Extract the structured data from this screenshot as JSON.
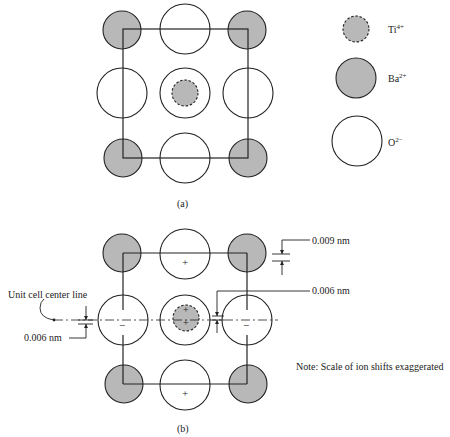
{
  "figure": {
    "part_a": {
      "caption": "(a)",
      "description": "Unit cell of BaTiO3 projected: Ba2+ corners, O2- edge/face centers, Ti4+ at center"
    },
    "part_b": {
      "caption": "(b)",
      "description": "Tetragonal distortion showing ion shifts relative to unit cell center line"
    },
    "legend": {
      "items": [
        {
          "ion": "Ti",
          "charge": "4+",
          "style": "dashed-gray"
        },
        {
          "ion": "Ba",
          "charge": "2+",
          "style": "solid-gray"
        },
        {
          "ion": "O",
          "charge": "2−",
          "style": "white"
        }
      ]
    },
    "annotations": {
      "center_line_label": "Unit cell center line",
      "shift_ba": "0.009 nm",
      "shift_ti": "0.006 nm",
      "shift_o": "0.006 nm",
      "note": "Note:  Scale of ion shifts exaggerated"
    },
    "signs": {
      "plus": "+",
      "minus": "−"
    },
    "colors": {
      "gray_fill": "#b8b8b8",
      "stroke": "#222222"
    }
  }
}
